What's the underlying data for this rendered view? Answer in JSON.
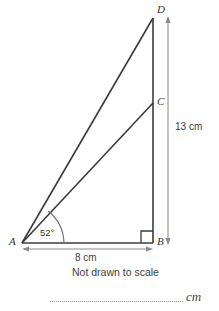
{
  "figure": {
    "vertices": [
      {
        "id": "A",
        "label": "A",
        "x": 22,
        "y": 243
      },
      {
        "id": "B",
        "label": "B",
        "x": 153,
        "y": 243
      },
      {
        "id": "C",
        "label": "C",
        "x": 153,
        "y": 103
      },
      {
        "id": "D",
        "label": "D",
        "x": 153,
        "y": 18
      }
    ],
    "angle": {
      "label": "52°",
      "vertex": "A",
      "between": [
        "A-B",
        "A-C"
      ]
    },
    "right_angle": {
      "vertex": "B",
      "marker": "square"
    },
    "dimensions": [
      {
        "id": "base",
        "label": "8 cm",
        "from": "A",
        "to": "B",
        "orientation": "horizontal"
      },
      {
        "id": "height",
        "label": "13 cm",
        "from": "B",
        "to": "D",
        "orientation": "vertical"
      }
    ],
    "segments": [
      "A-B",
      "A-C",
      "A-D",
      "B-D"
    ],
    "note": "Not drawn to scale",
    "answer_unit": "cm",
    "colors": {
      "stroke": "#3b3b3b",
      "dimension_stroke": "#8a8a8a",
      "background": "#ffffff",
      "text": "#3a3a3a"
    }
  }
}
